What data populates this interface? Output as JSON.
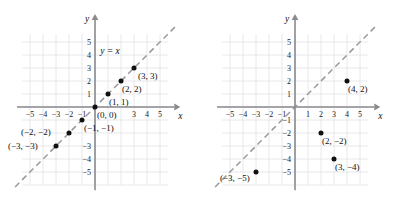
{
  "figure": {
    "title": "",
    "panels": [
      "left",
      "right"
    ]
  },
  "chart_data": [
    {
      "type": "scatter",
      "panel": "left",
      "title": "",
      "xlabel": "x",
      "ylabel": "y",
      "xlim": [
        -6,
        6
      ],
      "ylim": [
        -6,
        6
      ],
      "grid": true,
      "legend": "none",
      "x_ticks": [
        -5,
        -4,
        -3,
        -2,
        -1,
        3,
        4,
        5
      ],
      "x_tick_labels": [
        "-5",
        "-4",
        "-3",
        "-2",
        "-1",
        "3",
        "4",
        "5"
      ],
      "y_ticks": [
        5,
        4,
        3,
        2,
        1,
        -3,
        -4,
        -5
      ],
      "y_tick_labels": [
        "5",
        "4",
        "3",
        "2",
        "1",
        "-3",
        "-4",
        "-5"
      ],
      "annotations": [
        {
          "text": "y = x",
          "x": 1.15,
          "y": 4.05,
          "anchor": "middle",
          "italic": true
        }
      ],
      "lines": [
        {
          "name": "y = x",
          "slope": 1,
          "intercept": 0,
          "style": "dashed",
          "color": "#9a9a9e"
        }
      ],
      "points": [
        {
          "x": 3,
          "y": 3,
          "label": "(3, 3)",
          "label_dx": 4,
          "label_dy": 11
        },
        {
          "x": 2,
          "y": 2,
          "label": "(2, 2)",
          "label_dx": 1,
          "label_dy": 11
        },
        {
          "x": 1,
          "y": 1,
          "label": "(1, 1)",
          "label_dx": 1,
          "label_dy": 11
        },
        {
          "x": 0,
          "y": 0,
          "label": "(0, 0)",
          "label_dx": 2,
          "label_dy": 11
        },
        {
          "x": -1,
          "y": -1,
          "label": "(-1, -1)",
          "label_dx": 2,
          "label_dy": 11
        },
        {
          "x": -2,
          "y": -2,
          "label": "(-2, -2)",
          "label_dx": -48,
          "label_dy": 2
        },
        {
          "x": -3,
          "y": -3,
          "label": "(-3, -3)",
          "label_dx": -48,
          "label_dy": 3
        }
      ]
    },
    {
      "type": "scatter",
      "panel": "right",
      "title": "",
      "xlabel": "x",
      "ylabel": "y",
      "xlim": [
        -6,
        6
      ],
      "ylim": [
        -6,
        6
      ],
      "grid": true,
      "legend": "none",
      "x_ticks": [
        -5,
        -4,
        -3,
        -2,
        -1,
        1,
        2,
        3,
        4,
        5
      ],
      "x_tick_labels": [
        "-5",
        "-4",
        "-3",
        "-2",
        "-1",
        "1",
        "2",
        "3",
        "4",
        "5"
      ],
      "y_ticks": [
        5,
        4,
        3,
        2,
        1,
        -1,
        -2,
        -3,
        -4,
        -5
      ],
      "y_tick_labels": [
        "5",
        "4",
        "3",
        "2",
        "1",
        "-1",
        "-2",
        "-3",
        "-4",
        "-5"
      ],
      "annotations": [],
      "lines": [
        {
          "name": "y = x",
          "slope": 1,
          "intercept": 0,
          "style": "dashed",
          "color": "#9a9a9e"
        }
      ],
      "points": [
        {
          "x": 4,
          "y": 2,
          "label": "(4, 2)",
          "label_dx": 1,
          "label_dy": 11
        },
        {
          "x": 2,
          "y": -2,
          "label": "(2, -2)",
          "label_dx": 1,
          "label_dy": 11
        },
        {
          "x": 3,
          "y": -4,
          "label": "(3, -4)",
          "label_dx": 1,
          "label_dy": 11
        },
        {
          "x": -3,
          "y": -5,
          "label": "(-3, -5)",
          "label_dx": -36,
          "label_dy": 9
        }
      ]
    }
  ],
  "geometry": {
    "left": {
      "origin_x": 95,
      "origin_y": 107,
      "unit": 13,
      "grid_x0": -5.6,
      "grid_x1": 5.6,
      "grid_y0": -6.0,
      "grid_y1": 5.6,
      "axis_x0": -6.0,
      "axis_x1": 6.1,
      "axis_y0": -6.4,
      "axis_y1": 6.7
    },
    "right": {
      "origin_x": 96,
      "origin_y": 107,
      "unit": 13,
      "grid_x0": -5.6,
      "grid_x1": 5.6,
      "grid_y0": -6.0,
      "grid_y1": 5.6,
      "axis_x0": -6.0,
      "axis_x1": 6.1,
      "axis_y0": -6.4,
      "axis_y1": 6.7
    }
  }
}
